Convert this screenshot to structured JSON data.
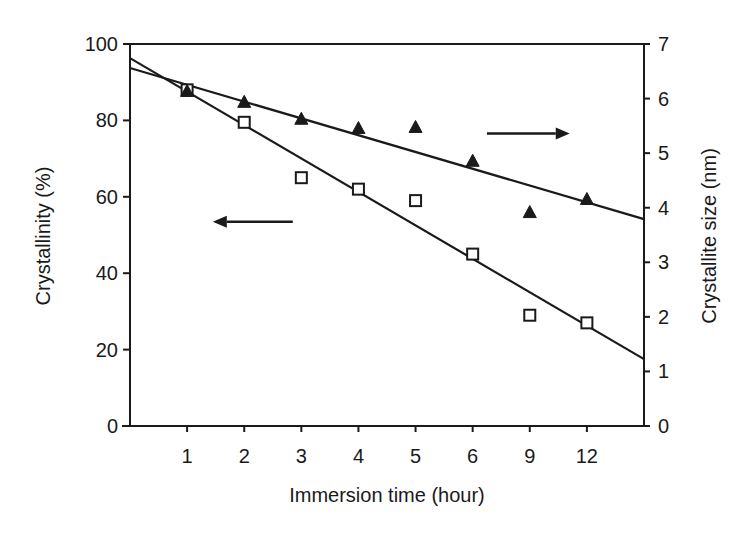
{
  "chart_data": {
    "type": "scatter",
    "title": "",
    "xlabel": "Immersion time (hour)",
    "ylabel_left": "Crystallinity (%)",
    "ylabel_right": "Crystallite size (nm)",
    "categories": [
      "1",
      "2",
      "3",
      "4",
      "5",
      "6",
      "9",
      "12"
    ],
    "x_index_range": [
      0,
      9
    ],
    "ylim_left": [
      0,
      100
    ],
    "ylim_right": [
      0,
      7
    ],
    "yticks_left": [
      0,
      20,
      40,
      60,
      80,
      100
    ],
    "yticks_right": [
      0,
      1,
      2,
      3,
      4,
      5,
      6,
      7
    ],
    "grid": false,
    "legend": "none",
    "series": [
      {
        "name": "Crystallinity",
        "axis": "left",
        "marker": "open-square",
        "values": [
          88,
          79.5,
          65,
          62,
          59,
          45,
          29,
          27
        ],
        "fit_line": {
          "start": [
            0,
            96.3
          ],
          "end": [
            9,
            17.5
          ]
        }
      },
      {
        "name": "Crystallite size",
        "axis": "right",
        "marker": "filled-triangle",
        "values": [
          6.14,
          5.94,
          5.63,
          5.46,
          5.48,
          4.86,
          3.92,
          4.16
        ],
        "fit_line": {
          "start": [
            0,
            6.56
          ],
          "end": [
            9,
            3.79
          ]
        }
      }
    ],
    "annotations": [
      {
        "type": "arrow",
        "direction": "left",
        "meaning": "crystallinity series uses left axis",
        "from": [
          2.85,
          53.5
        ],
        "to": [
          1.45,
          53.5
        ]
      },
      {
        "type": "arrow",
        "direction": "right",
        "meaning": "crystallite size series uses right axis",
        "from": [
          6.25,
          5.36
        ],
        "to": [
          7.7,
          5.36
        ]
      }
    ]
  }
}
